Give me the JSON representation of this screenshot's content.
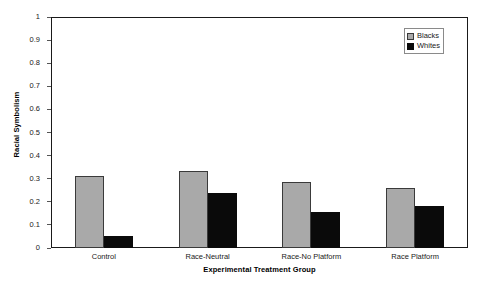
{
  "chart_data": {
    "type": "bar",
    "title": "",
    "xlabel": "Experimental Treatment Group",
    "ylabel": "Racial Symbolism",
    "categories": [
      "Control",
      "Race-Neutral",
      "Race-No Platform",
      "Race Platform"
    ],
    "series": [
      {
        "name": "Blacks",
        "color": "#a9a9a9",
        "values": [
          0.31,
          0.335,
          0.285,
          0.26
        ]
      },
      {
        "name": "Whites",
        "color": "#0a0a0a",
        "values": [
          0.05,
          0.24,
          0.155,
          0.18
        ]
      }
    ],
    "ylim": [
      0,
      1
    ],
    "ytick_values": [
      0,
      0.1,
      0.2,
      0.3,
      0.4,
      0.5,
      0.6,
      0.7,
      0.8,
      0.9,
      1
    ],
    "ytick_labels": [
      "0",
      "0.1",
      "0.2",
      "0.3",
      "0.4",
      "0.5",
      "0.6",
      "0.7",
      "0.8",
      "0.9",
      "1"
    ],
    "grid": false,
    "legend_position": "top-right",
    "legend_entries": [
      "Blacks",
      "Whites"
    ]
  }
}
